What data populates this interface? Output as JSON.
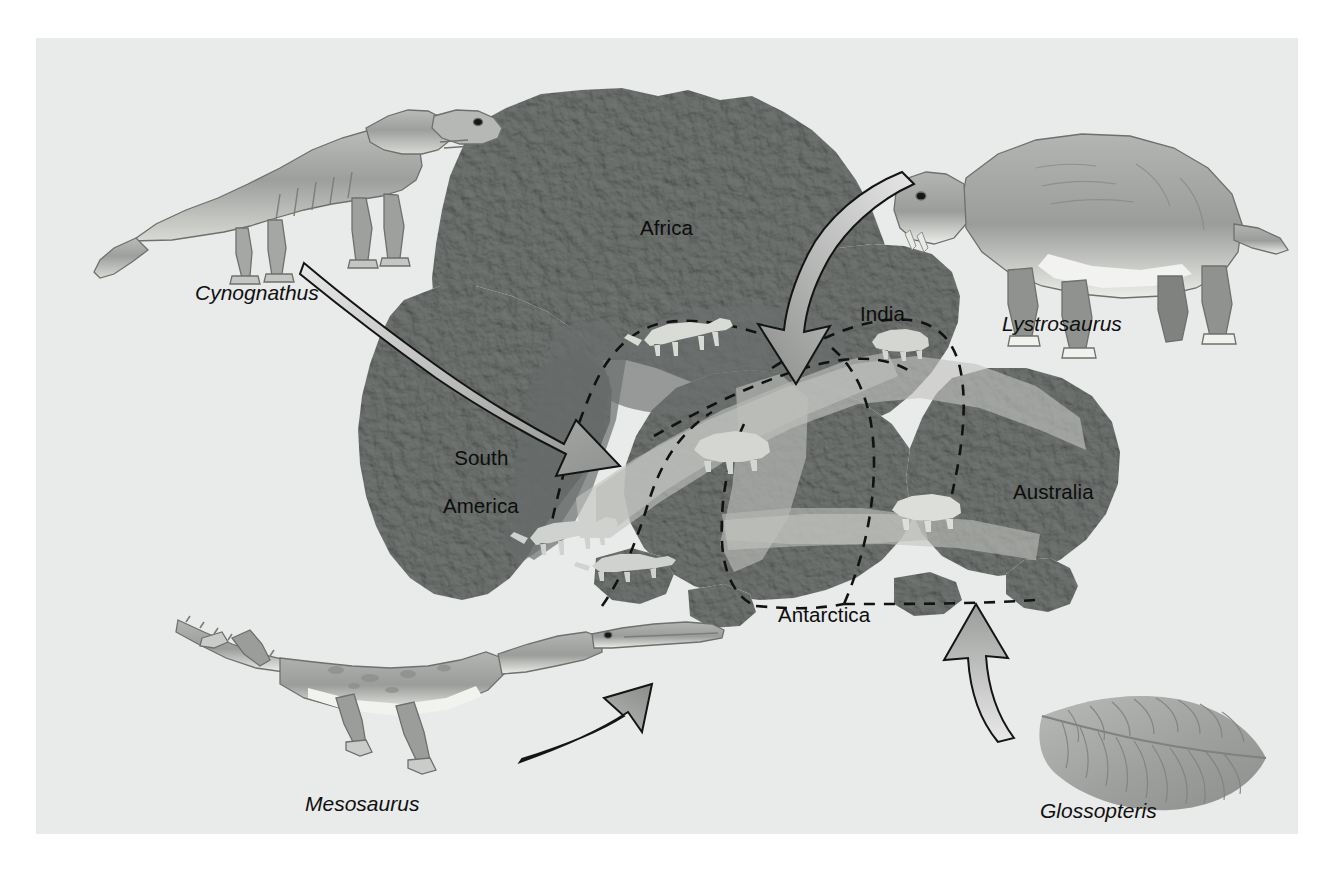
{
  "figure": {
    "background_color": "#e9eaea",
    "page_color": "#ffffff",
    "frame": {
      "x": 36,
      "y": 38,
      "width": 1262,
      "height": 796
    }
  },
  "palette": {
    "land_base": "#8f9290",
    "land_dark": "#6e7270",
    "land_light": "#b9bcba",
    "ocean": "#e9eaea",
    "range_cynognathus": "#6f7472",
    "range_mesosaurus": "#70746f",
    "range_lystrosaurus": "#a7aaa6",
    "range_glossopteris": "#b6b8b4",
    "arrow_outline": "#1a1a1a",
    "arrow_fill_light": "#e4e5e4",
    "arrow_fill_dark": "#8d8f8d",
    "dashed_line": "#141414",
    "text": "#0d0d0d",
    "fossil_silhouette": "#d8dad6"
  },
  "continents": [
    {
      "id": "africa",
      "label": "Africa",
      "label_x": 604,
      "label_y": 178
    },
    {
      "id": "south-america",
      "label": "South America",
      "label_x": 386,
      "label_y": 389,
      "multiline": true,
      "line1": "South",
      "line2": "America"
    },
    {
      "id": "india",
      "label": "India",
      "label_x": 824,
      "label_y": 264
    },
    {
      "id": "australia",
      "label": "Australia",
      "label_x": 977,
      "label_y": 442
    },
    {
      "id": "antarctica",
      "label": "Antarctica",
      "label_x": 742,
      "label_y": 565
    }
  ],
  "taxa": [
    {
      "id": "cynognathus",
      "label": "Cynognathus",
      "label_x": 159,
      "label_y": 243,
      "description": "terrestrial mammal-like reptile, illustrated upper-left",
      "arrow": "curved arrow from upper-left pointing down-right into the South America / Africa join",
      "range_color": "#6f7472"
    },
    {
      "id": "lystrosaurus",
      "label": "Lystrosaurus",
      "label_x": 966,
      "label_y": 252,
      "description": "stocky land reptile, illustrated upper-right",
      "arrow": "curved arrow from upper-right pointing down-left toward India",
      "range_color": "#a7aaa6"
    },
    {
      "id": "mesosaurus",
      "label": "Mesosaurus",
      "label_x": 269,
      "label_y": 754,
      "description": "freshwater aquatic reptile, illustrated lower-left",
      "arrow": "curved arrow sweeping right and up toward the South America coast",
      "range_color": "#70746f"
    },
    {
      "id": "glossopteris",
      "label": "Glossopteris",
      "label_x": 1004,
      "label_y": 761,
      "description": "fern-like seed plant leaf, illustrated lower-right",
      "arrow": "curved arrow pointing up from the leaf into Antarctica / Australia",
      "range_color": "#b6b8b4"
    }
  ],
  "annotations": {
    "dashed_boundaries": "dashed black lines delimiting the fossil range of each taxon across the reassembled continents",
    "fossil_silhouettes": "small light-gray animal silhouettes drawn inside their respective shaded fossil ranges"
  }
}
